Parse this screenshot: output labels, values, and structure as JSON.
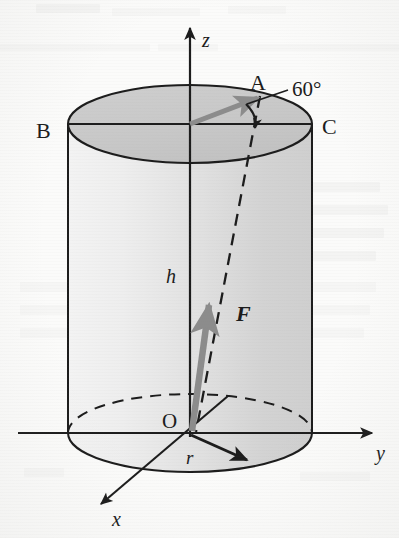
{
  "figure": {
    "name": "cylinder-cylindrical-coordinates-figure",
    "colors": {
      "ink": "#1c1c1c",
      "vector_gray": "#8c8c8c",
      "top_face_fill": "#c9c9c9",
      "body_fill_left": "#f1f1f1",
      "body_fill_right": "#d2d2d2",
      "paper": "#fbfbfa"
    }
  },
  "axes": [
    {
      "key": "z",
      "label": "z",
      "direction": "up"
    },
    {
      "key": "y",
      "label": "y",
      "direction": "right"
    },
    {
      "key": "x",
      "label": "x",
      "direction": "down-left"
    }
  ],
  "points": [
    {
      "key": "A",
      "label": "A"
    },
    {
      "key": "B",
      "label": "B"
    },
    {
      "key": "C",
      "label": "C"
    },
    {
      "key": "O",
      "label": "O"
    }
  ],
  "dimensions": [
    {
      "key": "h",
      "label": "h",
      "meaning": "cylinder height"
    },
    {
      "key": "r",
      "label": "r",
      "meaning": "cylinder radius"
    }
  ],
  "vectors": [
    {
      "key": "F",
      "label": "F",
      "style": "bold-italic",
      "color": "#8c8c8c"
    },
    {
      "key": "OA",
      "label": "",
      "style": "gray-arrow",
      "color": "#8c8c8c"
    }
  ],
  "annotations": [
    {
      "key": "angle",
      "label": "60°",
      "meaning": "angle at top face between OA and OC"
    }
  ]
}
